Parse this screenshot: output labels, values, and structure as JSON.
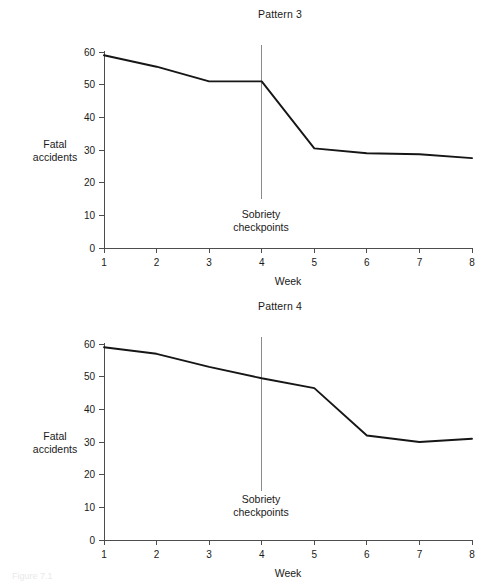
{
  "figure": {
    "caption": "Figure 7.1",
    "background_color": "#ffffff",
    "line_color": "#161616",
    "axis_color": "#4d4d4d",
    "reference_line_color": "#8a8a8a"
  },
  "panels": [
    {
      "id": "pattern3",
      "title": "Pattern 3",
      "ylabel_line1": "Fatal",
      "ylabel_line2": "accidents",
      "xlabel": "Week",
      "reference_line_label_line1": "Sobriety",
      "reference_line_label_line2": "checkpoints"
    },
    {
      "id": "pattern4",
      "title": "Pattern 4",
      "ylabel_line1": "Fatal",
      "ylabel_line2": "accidents",
      "xlabel": "Week",
      "reference_line_label_line1": "Sobriety",
      "reference_line_label_line2": "checkpoints"
    }
  ],
  "chart_data": [
    {
      "type": "line",
      "title": "Pattern 3",
      "xlabel": "Week",
      "ylabel": "Fatal accidents",
      "x": [
        1,
        2,
        3,
        4,
        5,
        6,
        7,
        8
      ],
      "values": [
        59,
        55.5,
        51,
        51,
        30.5,
        29,
        28.7,
        27.5
      ],
      "xtick_labels": [
        "1",
        "2",
        "3",
        "4",
        "5",
        "6",
        "7",
        "8"
      ],
      "ytick_labels": [
        "0",
        "10",
        "20",
        "30",
        "40",
        "50",
        "60"
      ],
      "yticks": [
        0,
        10,
        20,
        30,
        40,
        50,
        60
      ],
      "xlim": [
        1,
        8
      ],
      "ylim": [
        0,
        60
      ],
      "grid": false,
      "legend": false,
      "annotations": [
        {
          "type": "vertical-reference-line",
          "x": 4,
          "label": "Sobriety checkpoints",
          "y_top": 62,
          "y_bottom": 15
        }
      ]
    },
    {
      "type": "line",
      "title": "Pattern 4",
      "xlabel": "Week",
      "ylabel": "Fatal accidents",
      "x": [
        1,
        2,
        3,
        4,
        5,
        6,
        7,
        8
      ],
      "values": [
        59,
        57,
        53,
        49.5,
        46.5,
        32,
        30,
        31
      ],
      "xtick_labels": [
        "1",
        "2",
        "3",
        "4",
        "5",
        "6",
        "7",
        "8"
      ],
      "ytick_labels": [
        "0",
        "10",
        "20",
        "30",
        "40",
        "50",
        "60"
      ],
      "yticks": [
        0,
        10,
        20,
        30,
        40,
        50,
        60
      ],
      "xlim": [
        1,
        8
      ],
      "ylim": [
        0,
        60
      ],
      "grid": false,
      "legend": false,
      "annotations": [
        {
          "type": "vertical-reference-line",
          "x": 4,
          "label": "Sobriety checkpoints",
          "y_top": 62,
          "y_bottom": 15
        }
      ]
    }
  ]
}
